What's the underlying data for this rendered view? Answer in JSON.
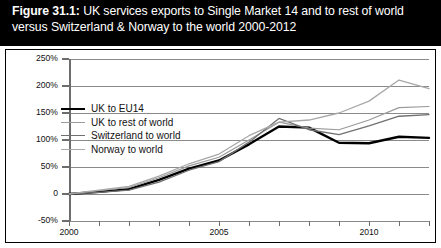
{
  "figure": {
    "number_label": "Figure 31.1:",
    "title_rest": " UK services exports to Single Market 14 and to rest of world versus Switzerland & Norway to the world 2000-2012"
  },
  "chart_data": {
    "type": "line",
    "title": "Figure 31.1: UK services exports to Single Market 14 and to rest of world versus Switzerland & Norway to the world 2000-2012",
    "xlabel": "",
    "ylabel": "",
    "x": [
      2000,
      2001,
      2002,
      2003,
      2004,
      2005,
      2006,
      2007,
      2008,
      2009,
      2010,
      2011,
      2012
    ],
    "xlim": [
      2000,
      2012
    ],
    "ylim": [
      -50,
      250
    ],
    "ytick_labels": [
      "250%",
      "200%",
      "150%",
      "100%",
      "50%",
      "0",
      "-50%"
    ],
    "ytick_values": [
      250,
      200,
      150,
      100,
      50,
      0,
      -50
    ],
    "xtick_labels": [
      "2000",
      "2005",
      "2010"
    ],
    "xtick_values": [
      2000,
      2005,
      2010
    ],
    "grid": true,
    "legend_position": "upper left",
    "series": [
      {
        "name": "UK to EU14",
        "color": "#000000",
        "width": 2.4,
        "values": [
          0,
          4,
          9,
          26,
          47,
          62,
          92,
          125,
          123,
          95,
          94,
          106,
          104
        ]
      },
      {
        "name": "UK to rest of world",
        "color": "#9a9a9a",
        "width": 1.2,
        "values": [
          0,
          6,
          12,
          30,
          52,
          68,
          100,
          133,
          122,
          119,
          137,
          160,
          162
        ]
      },
      {
        "name": "Switzerland to world",
        "color": "#707070",
        "width": 1.3,
        "values": [
          0,
          3,
          7,
          22,
          44,
          60,
          96,
          140,
          119,
          110,
          126,
          144,
          147
        ]
      },
      {
        "name": "Norway to world",
        "color": "#a8a8a8",
        "width": 1.3,
        "values": [
          0,
          7,
          14,
          33,
          56,
          74,
          108,
          133,
          137,
          150,
          172,
          211,
          195
        ]
      }
    ]
  }
}
